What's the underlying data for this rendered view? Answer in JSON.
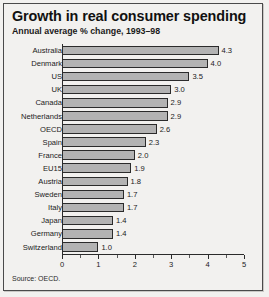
{
  "chart_data": {
    "type": "bar",
    "orientation": "horizontal",
    "title": "Growth in real consumer spending",
    "subtitle": "Annual average % change, 1993–98",
    "source": "Source: OECD.",
    "xlabel": "",
    "ylabel": "",
    "xlim": [
      0,
      5
    ],
    "xticks": [
      0,
      1,
      2,
      3,
      4,
      5
    ],
    "xtick_labels": [
      "0",
      "1",
      "2",
      "3",
      "4",
      "5"
    ],
    "minor_tick_step": 0.5,
    "grid": false,
    "legend": "none",
    "bar_fill": "#b3b3b3",
    "bar_border": "#2b2b2b",
    "background": "#f2f1ef",
    "categories": [
      "Australia",
      "Denmark",
      "US",
      "UK",
      "Canada",
      "Netherlands",
      "OECD",
      "Spain",
      "France",
      "EU15",
      "Austria",
      "Sweden",
      "Italy",
      "Japan",
      "Germany",
      "Switzerland"
    ],
    "values": [
      4.3,
      4.0,
      3.5,
      3.0,
      2.9,
      2.9,
      2.6,
      2.3,
      2.0,
      1.9,
      1.8,
      1.7,
      1.7,
      1.4,
      1.4,
      1.0
    ],
    "value_labels": [
      "4.3",
      "4.0",
      "3.5",
      "3.0",
      "2.9",
      "2.9",
      "2.6",
      "2.3",
      "2.0",
      "1.9",
      "1.8",
      "1.7",
      "1.7",
      "1.4",
      "1.4",
      "1.0"
    ]
  }
}
